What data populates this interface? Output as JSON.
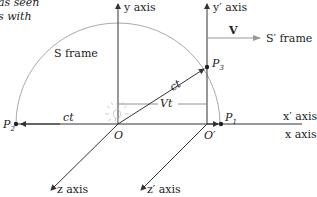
{
  "caption": {
    "line1": "as seen",
    "line2": "s with"
  },
  "frames": {
    "s_frame_label": "S frame",
    "s_prime_frame_label": "S′ frame",
    "velocity_label": "V"
  },
  "axes": {
    "y": "y axis",
    "y_prime": "y′ axis",
    "x": "x axis",
    "x_prime": "x′ axis",
    "z": "z axis",
    "z_prime": "z′ axis"
  },
  "points": {
    "origin": "O",
    "origin_prime": "O′",
    "p1": {
      "letter": "P",
      "sub": "1"
    },
    "p2": {
      "letter": "P",
      "sub": "2"
    },
    "p3": {
      "letter": "P",
      "sub": "3"
    }
  },
  "distances": {
    "ct_horizontal": "ct",
    "ct_diagonal": "ct",
    "vt": "Vt"
  },
  "colors": {
    "line": "#333333",
    "arc": "#aaaaaa",
    "v_arrow": "#999999",
    "bulb": "#bbbbbb"
  }
}
